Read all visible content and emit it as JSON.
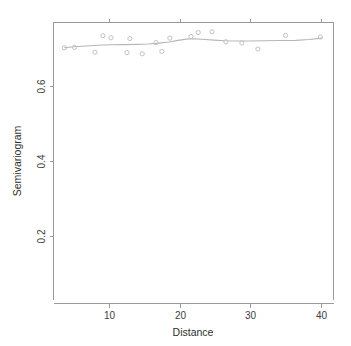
{
  "chart_data": {
    "type": "scatter",
    "title": "",
    "subtitle": "",
    "xlabel": "Distance",
    "ylabel": "Semivariogram",
    "xlim": [
      2.5,
      41.0
    ],
    "ylim": [
      0.085,
      0.775
    ],
    "xticks": [
      10,
      20,
      30,
      40
    ],
    "yticks": [
      0.2,
      0.4,
      0.6
    ],
    "xtick_labels": [
      "10",
      "20",
      "30",
      "40"
    ],
    "ytick_labels": [
      "0.2",
      "0.4",
      "0.6"
    ],
    "grid": false,
    "legend": null,
    "box": "left-top-right",
    "marker": "open-circle",
    "marker_color": "#c2c2c2",
    "line_color": "#b6b6b6",
    "axis_color": "#9a9a9a",
    "x": [
      4.0,
      5.4,
      8.2,
      9.3,
      10.4,
      12.6,
      13.0,
      14.7,
      16.6,
      17.4,
      18.5,
      21.4,
      22.4,
      24.3,
      26.2,
      28.4,
      30.6,
      34.4,
      39.2
    ],
    "y": [
      0.712,
      0.713,
      0.701,
      0.742,
      0.737,
      0.7,
      0.735,
      0.697,
      0.725,
      0.703,
      0.736,
      0.74,
      0.75,
      0.752,
      0.727,
      0.724,
      0.709,
      0.743,
      0.739
    ],
    "points": [
      {
        "x": 4.0,
        "y": 0.712
      },
      {
        "x": 5.4,
        "y": 0.713
      },
      {
        "x": 8.2,
        "y": 0.701
      },
      {
        "x": 9.3,
        "y": 0.742
      },
      {
        "x": 10.4,
        "y": 0.737
      },
      {
        "x": 12.6,
        "y": 0.7
      },
      {
        "x": 13.0,
        "y": 0.735
      },
      {
        "x": 14.7,
        "y": 0.697
      },
      {
        "x": 16.6,
        "y": 0.725
      },
      {
        "x": 17.4,
        "y": 0.703
      },
      {
        "x": 18.5,
        "y": 0.736
      },
      {
        "x": 21.4,
        "y": 0.74
      },
      {
        "x": 22.4,
        "y": 0.75
      },
      {
        "x": 24.3,
        "y": 0.752
      },
      {
        "x": 26.2,
        "y": 0.727
      },
      {
        "x": 28.4,
        "y": 0.724
      },
      {
        "x": 30.6,
        "y": 0.709
      },
      {
        "x": 34.4,
        "y": 0.743
      },
      {
        "x": 39.2,
        "y": 0.739
      }
    ],
    "series": [
      {
        "name": "semivariogram-points",
        "type": "scatter",
        "values": [
          0.712,
          0.713,
          0.701,
          0.742,
          0.737,
          0.7,
          0.735,
          0.697,
          0.725,
          0.703,
          0.736,
          0.74,
          0.75,
          0.752,
          0.727,
          0.724,
          0.709,
          0.743,
          0.739
        ]
      },
      {
        "name": "smoothed-fit",
        "type": "line",
        "x": [
          4.0,
          5.4,
          7.0,
          8.6,
          10.4,
          12.2,
          14.0,
          15.6,
          17.0,
          18.4,
          19.6,
          20.8,
          21.6,
          22.4,
          23.4,
          24.6,
          26.0,
          27.6,
          29.4,
          31.4,
          33.6,
          35.8,
          37.6,
          39.4
        ],
        "values": [
          0.712,
          0.7145,
          0.7165,
          0.7185,
          0.7195,
          0.72,
          0.7205,
          0.7215,
          0.7235,
          0.7265,
          0.7305,
          0.7335,
          0.7345,
          0.734,
          0.7325,
          0.731,
          0.7295,
          0.729,
          0.729,
          0.7295,
          0.73,
          0.7305,
          0.7325,
          0.736
        ]
      }
    ]
  },
  "axes": {
    "x_title": "Distance",
    "y_title": "Semivariogram"
  }
}
